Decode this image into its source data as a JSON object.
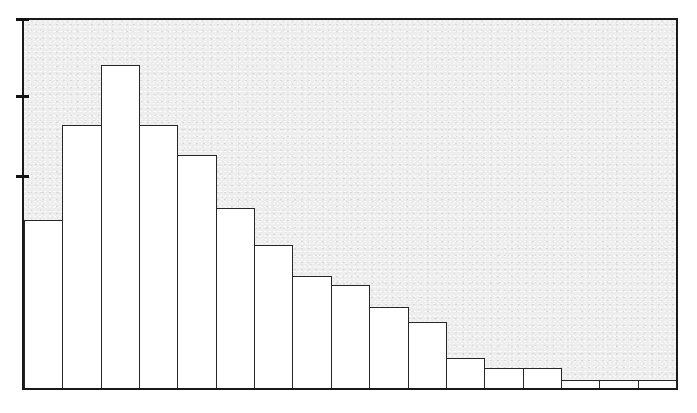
{
  "figure": {
    "background_color": "#ececec",
    "page_color": "#ffffff",
    "axis_color": "#1a1a1a",
    "bar_fill_color": "#ffffff",
    "bar_edge_color": "#262626"
  },
  "chart_data": {
    "type": "bar",
    "title": "",
    "subtitle": "",
    "xlabel": "",
    "ylabel": "",
    "legend": [],
    "grid": false,
    "tick_labels_visible": false,
    "axis_tick_positions_y_px": [
      18,
      95,
      175
    ],
    "ylim": [
      0,
      1.0
    ],
    "xlim": [
      0,
      17
    ],
    "categories": [
      "1",
      "2",
      "3",
      "4",
      "5",
      "6",
      "7",
      "8",
      "9",
      "10",
      "11",
      "12",
      "13",
      "14",
      "15",
      "16",
      "17"
    ],
    "values": [
      0.457,
      0.712,
      0.874,
      0.712,
      0.632,
      0.489,
      0.389,
      0.306,
      0.282,
      0.223,
      0.183,
      0.086,
      0.059,
      0.059,
      0.027,
      0.027,
      0.027
    ],
    "bar_tops_px": [
      220,
      125,
      65,
      125,
      155,
      208,
      245,
      276,
      285,
      307,
      322,
      358,
      368,
      368,
      380,
      380,
      380
    ],
    "baseline_px": 390,
    "plot_left_px": 22,
    "plot_right_px": 678,
    "plot_top_px": 18,
    "plot_bottom_px": 390,
    "bar_count": 17
  }
}
